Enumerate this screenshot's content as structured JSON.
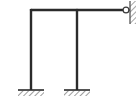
{
  "figure": {
    "type": "structural-frame-diagram",
    "width": 137,
    "height": 105,
    "background_color": "#ffffff",
    "member_color": "#2b2b2b",
    "hatch_color": "#4a4a4a",
    "wall_color": "#555555"
  },
  "members": {
    "beam": {
      "name": "horizontal-beam",
      "x1": 31,
      "y1": 10,
      "x2": 126,
      "y2": 10,
      "thickness": 2.4
    },
    "left_column": {
      "name": "left-column",
      "x1": 31,
      "y1": 10,
      "x2": 31,
      "y2": 90,
      "thickness": 2.4
    },
    "middle_column": {
      "name": "middle-column",
      "x1": 77,
      "y1": 10,
      "x2": 77,
      "y2": 90,
      "thickness": 2.4
    }
  },
  "joints": {
    "top_left_corner": {
      "name": "rigid-corner-joint",
      "x": 31,
      "y": 10,
      "kind": "rigid"
    },
    "beam_middle_tee": {
      "name": "rigid-tee-joint",
      "x": 77,
      "y": 10,
      "kind": "rigid"
    },
    "right_pin": {
      "name": "pin-hinge",
      "x": 126,
      "y": 10,
      "radius": 3,
      "kind": "pinned",
      "fill": "#ffffff",
      "stroke": "#3a3a3a"
    }
  },
  "supports": {
    "left_base": {
      "name": "fixed-support-left",
      "center_x": 31,
      "plate_y": 90,
      "plate_half_width": 13,
      "plate_thickness": 1.6,
      "hatch_depth": 6,
      "kind": "fixed"
    },
    "middle_base": {
      "name": "fixed-support-middle",
      "center_x": 77,
      "plate_y": 90,
      "plate_half_width": 13,
      "plate_thickness": 1.6,
      "hatch_depth": 6,
      "kind": "fixed"
    },
    "right_wall": {
      "name": "hatched-wall-right",
      "wall_x": 130,
      "wall_top": 1,
      "wall_bottom": 24,
      "hatch_depth": 6,
      "kind": "wall"
    }
  },
  "labels": {
    "diagram_caption": ""
  }
}
